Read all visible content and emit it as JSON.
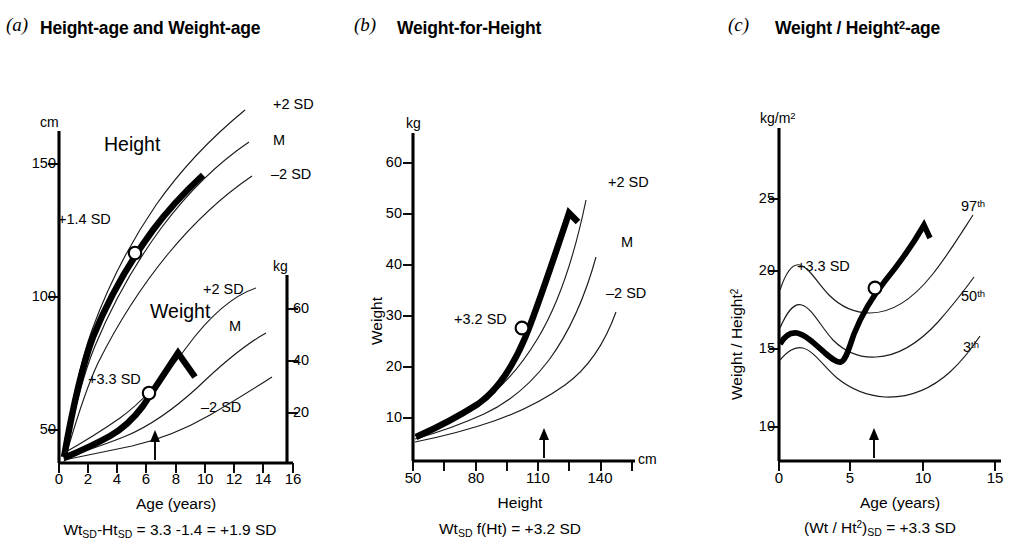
{
  "figure": {
    "background": "#ffffff",
    "ink": "#000000"
  },
  "panels": [
    {
      "letter": "(a)",
      "title": "Height-age and Weight-age",
      "left_unit": "cm",
      "right_unit": "kg",
      "left_ticks": [
        "150",
        "100",
        "50"
      ],
      "right_ticks": [
        "60",
        "40",
        "20"
      ],
      "x_ticks": [
        "0",
        "2",
        "4",
        "6",
        "8",
        "10",
        "12",
        "14",
        "16"
      ],
      "x_title": "Age (years)",
      "series": [
        {
          "name": "Height",
          "sd_annot": "+1.4 SD",
          "ref_labels": [
            "+2 SD",
            "M",
            "–2 SD"
          ]
        },
        {
          "name": "Weight",
          "sd_annot": "+3.3 SD",
          "ref_labels": [
            "+2 SD",
            "M",
            "–2 SD"
          ]
        }
      ],
      "formula": "Wt<sub>SD</sub>-Ht<sub>SD</sub> = 3.3 -1.4 = +1.9 SD"
    },
    {
      "letter": "(b)",
      "title": "Weight-for-Height",
      "left_unit": "kg",
      "right_unit": "cm",
      "left_ticks": [
        "60",
        "50",
        "40",
        "30",
        "20",
        "10"
      ],
      "x_ticks": [
        "50",
        "80",
        "110",
        "140"
      ],
      "x_title": "Height",
      "y_title": "Weight",
      "ref_labels": [
        "+2 SD",
        "M",
        "–2 SD"
      ],
      "sd_annot": "+3.2 SD",
      "formula": "Wt<sub>SD</sub> f(Ht)  = +3.2 SD"
    },
    {
      "letter": "(c)",
      "title": "Weight / Height<sup>2</sup>-age",
      "left_unit": "kg/m<sup>2</sup>",
      "left_ticks": [
        "25",
        "20",
        "15",
        "10"
      ],
      "x_ticks": [
        "0",
        "5",
        "10",
        "15"
      ],
      "x_title": "Age (years)",
      "y_title": "Weight / Height<sup>2</sup>",
      "ref_labels": [
        "97<sup>th</sup>",
        "50<sup>th</sup>",
        "3<sup>th</sup>"
      ],
      "sd_annot": "+3.3 SD",
      "formula": "(Wt / Ht<sup>2</sup>)<sub>SD</sub> =  +3.3 SD"
    }
  ],
  "chart_data": [
    {
      "type": "line",
      "title": "Height-age and Weight-age",
      "panel": "a",
      "xlabel": "Age (years)",
      "ylabel": "cm",
      "ylabel_secondary": "kg",
      "xlim": [
        0,
        16
      ],
      "ylim": [
        30,
        160
      ],
      "ylim_secondary": [
        8,
        72
      ],
      "xticks": [
        0,
        2,
        4,
        6,
        8,
        10,
        12,
        14,
        16
      ],
      "yticks": [
        50,
        100,
        150
      ],
      "yticks_secondary": [
        20,
        40,
        60
      ],
      "grid": false,
      "legend": "inline curve labels",
      "patient_marker_age": 6.6,
      "series": [
        {
          "name": "Height +2 SD",
          "axis": "left",
          "x": [
            0.4,
            1,
            2,
            4,
            6,
            8,
            10,
            12,
            14,
            15
          ],
          "values": [
            62,
            82,
            96,
            114,
            128,
            141,
            153,
            166,
            176,
            180
          ]
        },
        {
          "name": "Height M",
          "axis": "left",
          "x": [
            0.4,
            1,
            2,
            4,
            6,
            8,
            10,
            12,
            14,
            15
          ],
          "values": [
            58,
            76,
            89,
            105,
            118,
            130,
            141,
            152,
            163,
            168
          ]
        },
        {
          "name": "Height -2 SD",
          "axis": "left",
          "x": [
            0.4,
            1,
            2,
            4,
            6,
            8,
            10,
            12,
            14,
            15
          ],
          "values": [
            53,
            70,
            82,
            96,
            108,
            119,
            129,
            139,
            149,
            154
          ]
        },
        {
          "name": "Height patient",
          "axis": "left",
          "x": [
            0.4,
            1,
            2,
            4,
            6,
            6.6,
            8,
            9.5
          ],
          "values": [
            61,
            80,
            94,
            111,
            123,
            126,
            135,
            142
          ],
          "sd_score": 1.4,
          "marker_x": 6.6,
          "marker_y": 123
        },
        {
          "name": "Weight +2 SD",
          "axis": "right",
          "x": [
            0.4,
            2,
            4,
            6,
            8,
            10,
            12,
            14,
            15
          ],
          "values": [
            10,
            16,
            21,
            27,
            34,
            44,
            55,
            64,
            66
          ]
        },
        {
          "name": "Weight M",
          "axis": "right",
          "x": [
            0.4,
            2,
            4,
            6,
            8,
            10,
            12,
            14,
            15
          ],
          "values": [
            7.5,
            12.5,
            16.5,
            20.5,
            25,
            31,
            39,
            48,
            52
          ]
        },
        {
          "name": "Weight -2 SD",
          "axis": "right",
          "x": [
            0.4,
            2,
            4,
            6,
            8,
            10,
            12,
            14,
            15
          ],
          "values": [
            6,
            10,
            13,
            15.5,
            18.5,
            22,
            27,
            33,
            37
          ]
        },
        {
          "name": "Weight patient",
          "axis": "right",
          "x": [
            0.4,
            2,
            4,
            6,
            6.6,
            8,
            9.4,
            10.2
          ],
          "values": [
            7.5,
            13,
            18,
            26,
            30,
            40,
            50,
            46
          ],
          "sd_score": 3.3,
          "marker_x": 6.6,
          "marker_y": 30
        }
      ]
    },
    {
      "type": "line",
      "title": "Weight-for-Height",
      "panel": "b",
      "xlabel": "Height",
      "ylabel": "Weight",
      "xunit": "cm",
      "yunit": "kg",
      "xlim": [
        50,
        155
      ],
      "ylim": [
        0,
        65
      ],
      "xticks": [
        50,
        65,
        80,
        95,
        110,
        125,
        140,
        155
      ],
      "xtick_labels": [
        50,
        80,
        110,
        140
      ],
      "yticks": [
        10,
        20,
        30,
        40,
        50,
        60
      ],
      "grid": false,
      "patient_marker_height": 116,
      "series": [
        {
          "name": "+2 SD",
          "x": [
            50,
            70,
            90,
            100,
            110,
            120,
            130,
            140,
            145
          ],
          "values": [
            5.0,
            8.5,
            13.5,
            17.0,
            21.5,
            28.0,
            36.0,
            46.0,
            51.5
          ]
        },
        {
          "name": "M",
          "x": [
            50,
            70,
            90,
            100,
            110,
            120,
            130,
            140,
            148
          ],
          "values": [
            4.5,
            7.5,
            12.0,
            15.0,
            18.5,
            23.0,
            29.5,
            38.0,
            46.0
          ]
        },
        {
          "name": "-2 SD",
          "x": [
            50,
            70,
            90,
            100,
            110,
            120,
            130,
            140,
            150
          ],
          "values": [
            4.0,
            6.5,
            10.0,
            12.5,
            15.5,
            19.0,
            23.0,
            28.0,
            33.5
          ]
        },
        {
          "name": "patient",
          "x": [
            50,
            70,
            90,
            100,
            110,
            116,
            125,
            136,
            141
          ],
          "values": [
            5.0,
            8.5,
            13.5,
            17.0,
            22.5,
            27.0,
            36.0,
            49.5,
            46.0
          ],
          "sd_score": 3.2,
          "marker_x": 116,
          "marker_y": 27
        }
      ]
    },
    {
      "type": "line",
      "title": "Weight / Height²-age",
      "panel": "c",
      "xlabel": "Age (years)",
      "ylabel": "Weight / Height²",
      "yunit": "kg/m²",
      "xlim": [
        0,
        15.5
      ],
      "ylim": [
        8,
        27
      ],
      "xticks": [
        0,
        5,
        10,
        15
      ],
      "yticks": [
        10,
        15,
        20,
        25
      ],
      "grid": false,
      "patient_marker_age": 6.6,
      "series": [
        {
          "name": "97th",
          "x": [
            0,
            0.8,
            2,
            3.5,
            5,
            7,
            9,
            11,
            13,
            15
          ],
          "values": [
            18.8,
            20.1,
            18.9,
            17.9,
            17.6,
            17.9,
            18.8,
            20.3,
            22.2,
            24.2
          ]
        },
        {
          "name": "50th",
          "x": [
            0,
            0.8,
            2,
            3.5,
            5,
            7,
            9,
            11,
            13,
            15
          ],
          "values": [
            16.3,
            17.3,
            16.5,
            15.4,
            15.1,
            15.3,
            16.0,
            17.2,
            18.6,
            20.2
          ]
        },
        {
          "name": "3th",
          "x": [
            0,
            0.8,
            2,
            3.5,
            5,
            7,
            9,
            11,
            13,
            15
          ],
          "values": [
            14.3,
            14.6,
            14.2,
            13.3,
            12.9,
            12.7,
            12.9,
            13.4,
            14.2,
            15.2
          ]
        },
        {
          "name": "patient",
          "x": [
            0,
            0.8,
            1.8,
            3.0,
            3.6,
            4.4,
            5.4,
            6.6,
            8.3,
            9.8,
            10.2
          ],
          "values": [
            15.4,
            15.9,
            15.5,
            14.7,
            14.6,
            16.4,
            17.9,
            19.4,
            21.5,
            23.3,
            22.3
          ],
          "sd_score": 3.3,
          "marker_x": 6.6,
          "marker_y": 19.4
        }
      ]
    }
  ]
}
